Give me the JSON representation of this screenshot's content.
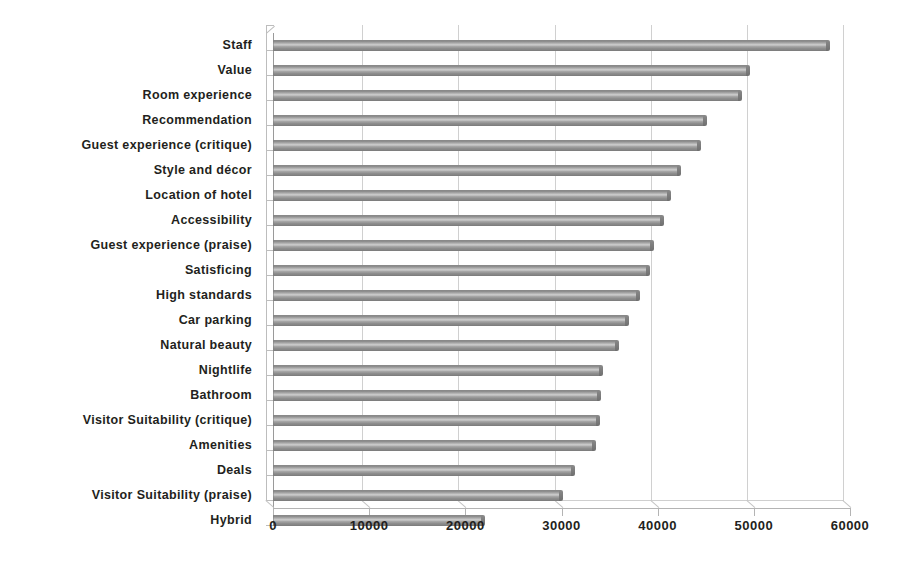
{
  "chart_data": {
    "type": "bar",
    "orientation": "horizontal",
    "title": "",
    "subtitle": "",
    "xlabel": "",
    "ylabel": "",
    "xlim": [
      0,
      60000
    ],
    "grid": true,
    "legend": false,
    "xticks": [
      "0",
      "10000",
      "20000",
      "30000",
      "40000",
      "50000",
      "60000"
    ],
    "xtick_values": [
      0,
      10000,
      20000,
      30000,
      40000,
      50000,
      60000
    ],
    "categories": [
      "Staff",
      "Value",
      "Room experience",
      "Recommendation",
      "Guest experience (critique)",
      "Style and décor",
      "Location of hotel",
      "Accessibility",
      "Guest experience (praise)",
      "Satisficing",
      "High standards",
      "Car parking",
      "Natural beauty",
      "Nightlife",
      "Bathroom",
      "Visitor Suitability (critique)",
      "Amenities",
      "Deals",
      "Visitor Suitability (praise)",
      "Hybrid"
    ],
    "values": [
      57600,
      49300,
      48500,
      44800,
      44200,
      42100,
      41100,
      40300,
      39300,
      38900,
      37900,
      36700,
      35700,
      34000,
      33800,
      33700,
      33300,
      31100,
      29800,
      21700
    ],
    "series": [
      {
        "name": "Mentions",
        "values": [
          57600,
          49300,
          48500,
          44800,
          44200,
          42100,
          41100,
          40300,
          39300,
          38900,
          37900,
          36700,
          35700,
          34000,
          33800,
          33700,
          33300,
          31100,
          29800,
          21700
        ]
      }
    ],
    "colors": {
      "bar_fill": "#a0a0a0",
      "bar_edge": "#7c7c7c",
      "gridline": "#d0d0d0",
      "axis": "#b4b4b4",
      "text": "#231f20",
      "background": "#ffffff"
    }
  }
}
